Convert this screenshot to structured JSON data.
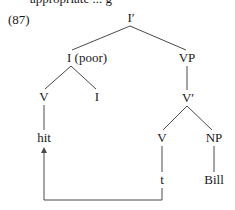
{
  "header": {
    "cut_text": "appropriate ... g"
  },
  "example": {
    "number": "(87)"
  },
  "tree": {
    "nodes": {
      "i_bar": "I′",
      "i_poor": "I (poor)",
      "vp": "VP",
      "v_left": "V",
      "i_head": "I",
      "v_bar": "V′",
      "v_right": "V",
      "np": "NP",
      "hit": "hit",
      "trace": "t",
      "bill": "Bill"
    },
    "movement_arrow": {
      "from": "t",
      "to": "hit"
    }
  },
  "colors": {
    "line": "#4a4a4a",
    "text": "#1a1a1a",
    "background": "#ffffff"
  }
}
